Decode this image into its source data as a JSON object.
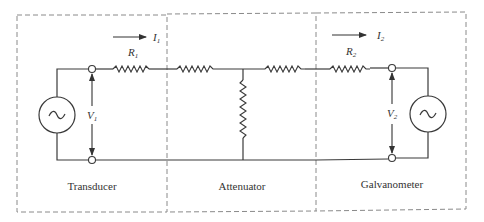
{
  "diagram": {
    "sections": [
      {
        "id": "transducer",
        "label": "Transducer"
      },
      {
        "id": "attenuator",
        "label": "Attenuator"
      },
      {
        "id": "galvanometer",
        "label": "Galvanometer"
      }
    ],
    "symbols": {
      "r1": {
        "main": "R",
        "sub": "1"
      },
      "r2": {
        "main": "R",
        "sub": "2"
      },
      "i1": {
        "main": "I",
        "sub": "1"
      },
      "i2": {
        "main": "I",
        "sub": "2"
      },
      "v1": {
        "main": "V",
        "sub": "1"
      },
      "v2": {
        "main": "V",
        "sub": "2"
      }
    },
    "sources": {
      "left_glyph": "~",
      "right_glyph": "~"
    }
  }
}
